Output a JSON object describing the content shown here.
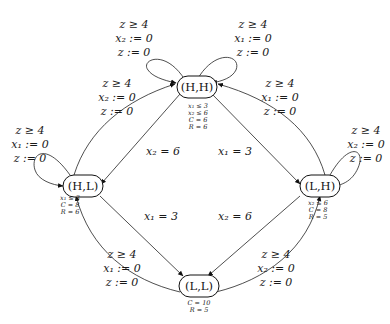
{
  "nodes": {
    "HH": {
      "label": "(H,H)",
      "invariants": [
        "x₁ ≤ 3",
        "x₂ ≤ 6",
        "C = 6",
        "R = 6"
      ]
    },
    "HL": {
      "label": "(H,L)",
      "invariants": [
        "x₁ ≤ 3",
        "C = 8",
        "R = 6"
      ]
    },
    "LH": {
      "label": "(L,H)",
      "invariants": [
        "x₂ ≤ 6",
        "C = 8",
        "R = 5"
      ]
    },
    "LL": {
      "label": "(L,L)",
      "invariants": [
        "C = 10",
        "R = 5"
      ]
    }
  },
  "edges": {
    "hh_self_left": {
      "from": "(H,H)",
      "to": "(H,H)",
      "lines": [
        "z ≥ 4",
        "x₂ := 0",
        "z := 0"
      ]
    },
    "hh_self_right": {
      "from": "(H,H)",
      "to": "(H,H)",
      "lines": [
        "z ≥ 4",
        "x₁ := 0",
        "z := 0"
      ]
    },
    "hl_self": {
      "from": "(H,L)",
      "to": "(H,L)",
      "lines": [
        "z ≥ 4",
        "x₁ := 0",
        "z := 0"
      ]
    },
    "lh_self": {
      "from": "(L,H)",
      "to": "(L,H)",
      "lines": [
        "z ≥ 4",
        "x₂ := 0",
        "z := 0"
      ]
    },
    "hl_to_hh": {
      "from": "(H,L)",
      "to": "(H,H)",
      "lines": [
        "z ≥ 4",
        "x₂ := 0",
        "z := 0"
      ]
    },
    "lh_to_hh": {
      "from": "(L,H)",
      "to": "(H,H)",
      "lines": [
        "z ≥ 4",
        "x₁ := 0",
        "z := 0"
      ]
    },
    "ll_to_hl": {
      "from": "(L,L)",
      "to": "(H,L)",
      "lines": [
        "z ≥ 4",
        "x₁ := 0",
        "z := 0"
      ]
    },
    "ll_to_lh": {
      "from": "(L,L)",
      "to": "(L,H)",
      "lines": [
        "z ≥ 4",
        "x₂ := 0",
        "z := 0"
      ]
    },
    "hh_to_hl": {
      "from": "(H,H)",
      "to": "(H,L)",
      "label": "x₂ = 6"
    },
    "hh_to_lh": {
      "from": "(H,H)",
      "to": "(L,H)",
      "label": "x₁ = 3"
    },
    "hl_to_ll": {
      "from": "(H,L)",
      "to": "(L,L)",
      "label": "x₁ = 3"
    },
    "lh_to_ll": {
      "from": "(L,H)",
      "to": "(L,L)",
      "label": "x₂ = 6"
    }
  }
}
